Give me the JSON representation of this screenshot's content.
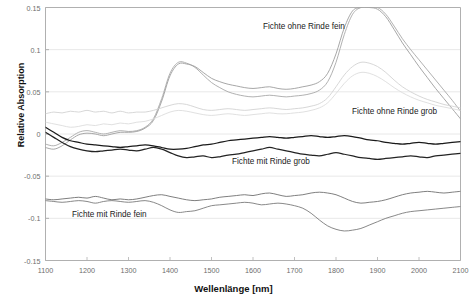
{
  "chart_data": {
    "type": "line",
    "title": "",
    "xlabel": "Wellenlänge [nm]",
    "ylabel": "Relative Absorption",
    "xlim": [
      1100,
      2100
    ],
    "ylim": [
      -0.15,
      0.15
    ],
    "xticks": [
      1100,
      1200,
      1300,
      1400,
      1500,
      1600,
      1700,
      1800,
      1900,
      2000,
      2100
    ],
    "xtick_labels": [
      "1100",
      "1200",
      "1300",
      "1400",
      "1500",
      "1600",
      "1700",
      "1800",
      "1900",
      "2000",
      "2100"
    ],
    "yticks": [
      0.15,
      0.1,
      0.05,
      0,
      -0.05,
      -0.1,
      -0.15
    ],
    "ytick_labels": [
      "0.15",
      "0.1",
      "0.05",
      "0",
      "-0.05",
      "-0.1",
      "-0.15"
    ],
    "grid": "horizontal-only",
    "legend_position": "inline-annotations",
    "annotations": [
      {
        "id": "ohne-fein",
        "text": "Fichte ohne Rinde fein",
        "x": 1740,
        "y": 0.132
      },
      {
        "id": "ohne-grob",
        "text": "Fichte ohne Rinde grob",
        "x": 1960,
        "y": 0.031
      },
      {
        "id": "mit-grob",
        "text": "Fichte mit Rinde grob",
        "x": 1590,
        "y": -0.028
      },
      {
        "id": "mit-fein",
        "text": "Fichte mit Rinde fein",
        "x": 1200,
        "y": -0.091
      }
    ],
    "x": [
      1100,
      1120,
      1140,
      1160,
      1180,
      1200,
      1220,
      1240,
      1260,
      1280,
      1300,
      1320,
      1340,
      1360,
      1380,
      1400,
      1420,
      1440,
      1460,
      1480,
      1500,
      1520,
      1540,
      1560,
      1580,
      1600,
      1620,
      1640,
      1660,
      1680,
      1700,
      1720,
      1740,
      1760,
      1780,
      1800,
      1820,
      1840,
      1860,
      1880,
      1900,
      1920,
      1940,
      1960,
      1980,
      2000,
      2020,
      2040,
      2060,
      2080,
      2100
    ],
    "series": [
      {
        "name": "Fichte ohne Rinde fein (a)",
        "color": "#a8a8a8",
        "width": 0.9,
        "values": [
          -0.012,
          -0.014,
          -0.01,
          -0.004,
          0.002,
          0.004,
          0.002,
          0.0,
          0.002,
          0.004,
          0.003,
          0.004,
          0.008,
          0.018,
          0.042,
          0.072,
          0.085,
          0.084,
          0.079,
          0.07,
          0.061,
          0.055,
          0.05,
          0.047,
          0.045,
          0.044,
          0.045,
          0.046,
          0.045,
          0.044,
          0.045,
          0.046,
          0.048,
          0.052,
          0.062,
          0.085,
          0.118,
          0.142,
          0.15,
          0.15,
          0.15,
          0.142,
          0.128,
          0.113,
          0.1,
          0.088,
          0.076,
          0.064,
          0.052,
          0.04,
          0.027
        ]
      },
      {
        "name": "Fichte ohne Rinde fein (b)",
        "color": "#9d9d9d",
        "width": 0.9,
        "values": [
          -0.016,
          -0.018,
          -0.014,
          -0.007,
          -0.001,
          0.001,
          0.0,
          -0.002,
          0.0,
          0.002,
          0.002,
          0.003,
          0.007,
          0.016,
          0.039,
          0.069,
          0.083,
          0.083,
          0.08,
          0.073,
          0.066,
          0.062,
          0.059,
          0.057,
          0.055,
          0.054,
          0.055,
          0.056,
          0.054,
          0.053,
          0.054,
          0.056,
          0.058,
          0.062,
          0.072,
          0.095,
          0.126,
          0.146,
          0.15,
          0.15,
          0.148,
          0.139,
          0.124,
          0.108,
          0.094,
          0.08,
          0.067,
          0.054,
          0.042,
          0.03,
          0.018
        ]
      },
      {
        "name": "Fichte ohne Rinde grob (a)",
        "color": "#d2d2d2",
        "width": 0.9,
        "values": [
          0.024,
          0.026,
          0.025,
          0.027,
          0.026,
          0.028,
          0.026,
          0.027,
          0.025,
          0.027,
          0.025,
          0.026,
          0.026,
          0.028,
          0.031,
          0.034,
          0.036,
          0.035,
          0.032,
          0.029,
          0.028,
          0.029,
          0.03,
          0.029,
          0.028,
          0.029,
          0.03,
          0.031,
          0.03,
          0.029,
          0.03,
          0.031,
          0.033,
          0.036,
          0.043,
          0.056,
          0.07,
          0.08,
          0.085,
          0.084,
          0.08,
          0.073,
          0.064,
          0.056,
          0.05,
          0.045,
          0.041,
          0.038,
          0.035,
          0.033,
          0.031
        ]
      },
      {
        "name": "Fichte ohne Rinde grob (b)",
        "color": "#dcdcdc",
        "width": 0.9,
        "values": [
          0.014,
          0.012,
          0.01,
          0.008,
          0.009,
          0.011,
          0.01,
          0.012,
          0.011,
          0.013,
          0.012,
          0.014,
          0.015,
          0.018,
          0.022,
          0.026,
          0.028,
          0.027,
          0.025,
          0.023,
          0.022,
          0.023,
          0.024,
          0.023,
          0.022,
          0.023,
          0.024,
          0.025,
          0.024,
          0.024,
          0.025,
          0.026,
          0.028,
          0.031,
          0.037,
          0.048,
          0.06,
          0.069,
          0.073,
          0.072,
          0.068,
          0.062,
          0.055,
          0.049,
          0.044,
          0.04,
          0.037,
          0.034,
          0.032,
          0.03,
          0.028
        ]
      },
      {
        "name": "Fichte mit Rinde grob (a)",
        "color": "#1a1a1a",
        "width": 1.25,
        "values": [
          0.008,
          0.002,
          -0.004,
          -0.008,
          -0.01,
          -0.012,
          -0.013,
          -0.014,
          -0.015,
          -0.016,
          -0.015,
          -0.014,
          -0.013,
          -0.014,
          -0.016,
          -0.018,
          -0.018,
          -0.017,
          -0.015,
          -0.013,
          -0.012,
          -0.01,
          -0.008,
          -0.007,
          -0.006,
          -0.005,
          -0.004,
          -0.003,
          -0.004,
          -0.005,
          -0.004,
          -0.003,
          -0.002,
          -0.003,
          -0.004,
          -0.003,
          -0.002,
          -0.003,
          -0.005,
          -0.007,
          -0.008,
          -0.01,
          -0.011,
          -0.012,
          -0.011,
          -0.01,
          -0.011,
          -0.012,
          -0.011,
          -0.01,
          -0.009
        ]
      },
      {
        "name": "Fichte mit Rinde grob (b)",
        "color": "#232323",
        "width": 1.25,
        "values": [
          0.002,
          -0.004,
          -0.01,
          -0.015,
          -0.018,
          -0.02,
          -0.021,
          -0.02,
          -0.019,
          -0.018,
          -0.019,
          -0.02,
          -0.018,
          -0.016,
          -0.018,
          -0.022,
          -0.026,
          -0.028,
          -0.027,
          -0.026,
          -0.028,
          -0.027,
          -0.025,
          -0.024,
          -0.022,
          -0.02,
          -0.018,
          -0.016,
          -0.018,
          -0.02,
          -0.022,
          -0.024,
          -0.025,
          -0.026,
          -0.024,
          -0.022,
          -0.024,
          -0.026,
          -0.028,
          -0.029,
          -0.03,
          -0.029,
          -0.028,
          -0.027,
          -0.026,
          -0.027,
          -0.028,
          -0.026,
          -0.025,
          -0.024,
          -0.023
        ]
      },
      {
        "name": "Fichte mit Rinde fein (a)",
        "color": "#707070",
        "width": 0.9,
        "values": [
          -0.077,
          -0.078,
          -0.077,
          -0.076,
          -0.075,
          -0.076,
          -0.074,
          -0.076,
          -0.078,
          -0.077,
          -0.078,
          -0.077,
          -0.075,
          -0.073,
          -0.072,
          -0.074,
          -0.076,
          -0.078,
          -0.079,
          -0.078,
          -0.077,
          -0.075,
          -0.074,
          -0.073,
          -0.072,
          -0.073,
          -0.071,
          -0.07,
          -0.072,
          -0.074,
          -0.073,
          -0.072,
          -0.07,
          -0.069,
          -0.07,
          -0.072,
          -0.076,
          -0.08,
          -0.082,
          -0.081,
          -0.08,
          -0.078,
          -0.075,
          -0.072,
          -0.07,
          -0.069,
          -0.068,
          -0.069,
          -0.07,
          -0.069,
          -0.068
        ]
      },
      {
        "name": "Fichte mit Rinde fein (b)",
        "color": "#7a7a7a",
        "width": 0.9,
        "values": [
          -0.079,
          -0.08,
          -0.081,
          -0.08,
          -0.079,
          -0.08,
          -0.082,
          -0.08,
          -0.079,
          -0.08,
          -0.081,
          -0.08,
          -0.079,
          -0.081,
          -0.085,
          -0.09,
          -0.093,
          -0.092,
          -0.091,
          -0.088,
          -0.085,
          -0.084,
          -0.083,
          -0.082,
          -0.081,
          -0.082,
          -0.084,
          -0.083,
          -0.082,
          -0.083,
          -0.085,
          -0.088,
          -0.094,
          -0.102,
          -0.109,
          -0.113,
          -0.115,
          -0.114,
          -0.112,
          -0.108,
          -0.104,
          -0.1,
          -0.097,
          -0.094,
          -0.092,
          -0.091,
          -0.09,
          -0.089,
          -0.088,
          -0.087,
          -0.086
        ]
      }
    ]
  },
  "axis": {
    "plot_frame_color": "#b0b0b0",
    "gridline_color": "#e8e8e8",
    "tick_label_color": "#6d6d6d"
  }
}
